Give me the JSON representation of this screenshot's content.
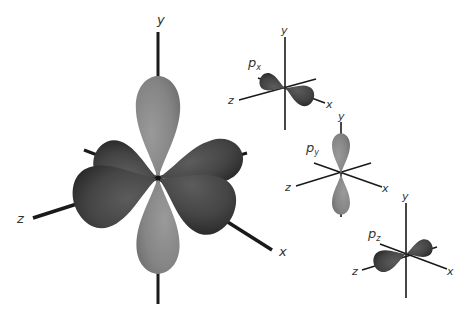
{
  "figure": {
    "colors": {
      "background": "#ffffff",
      "axis": "#1a1a1a",
      "lobe_dark": "#4a4a4a",
      "lobe_dark_shadow": "#2e2e2e",
      "lobe_light": "#8a8a8a",
      "lobe_light_shadow": "#6e6e6e",
      "label": "#333333"
    },
    "combined": {
      "axis_labels": {
        "y": "y",
        "z": "z",
        "x": "x"
      }
    },
    "px": {
      "label": "p",
      "subscript": "x",
      "axis_labels": {
        "y": "y",
        "z": "z",
        "x": "x"
      }
    },
    "py": {
      "label": "p",
      "subscript": "y",
      "axis_labels": {
        "y": "y",
        "z": "z",
        "x": "x"
      }
    },
    "pz": {
      "label": "p",
      "subscript": "z",
      "axis_labels": {
        "y": "y",
        "z": "z",
        "x": "x"
      }
    }
  }
}
